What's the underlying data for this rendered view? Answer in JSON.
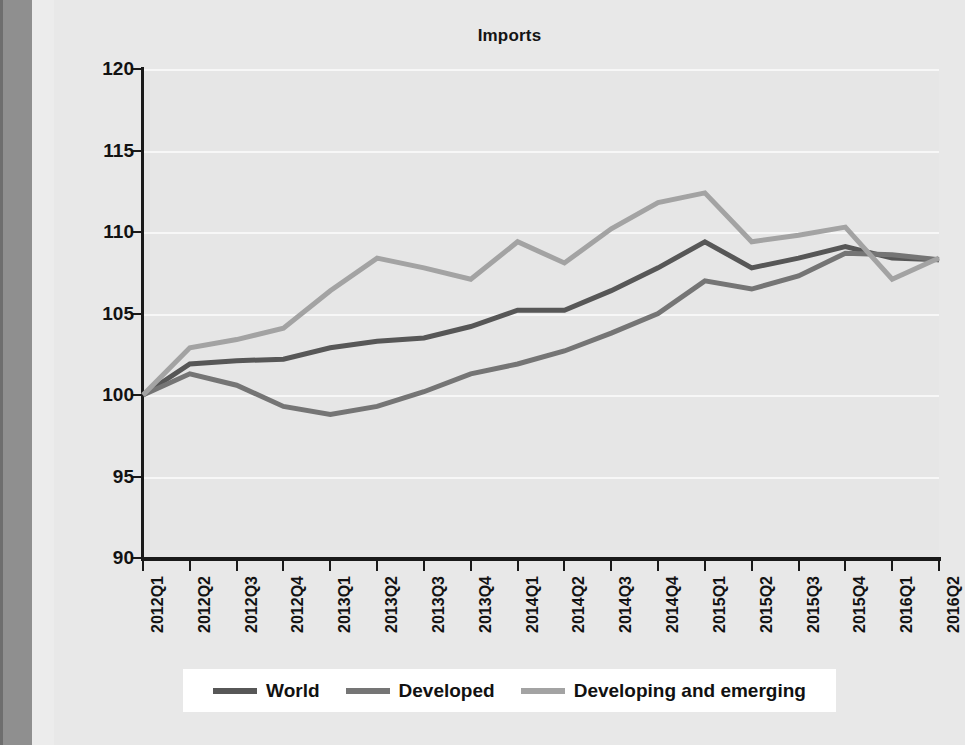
{
  "figure": {
    "title": "Imports",
    "background_color": "#e8e8e8",
    "plot_background_color": "#e6e6e6",
    "gridline_color": "#f7f7f7",
    "axis_color": "#1a1a1a"
  },
  "legend": {
    "position": "bottom",
    "items": [
      {
        "label": "World",
        "color": "#575757"
      },
      {
        "label": "Developed",
        "color": "#757575"
      },
      {
        "label": "Developing and emerging",
        "color": "#a3a3a3"
      }
    ]
  },
  "axes": {
    "y_ticks": [
      "120",
      "115",
      "110",
      "105",
      "100",
      "95",
      "90"
    ],
    "x_ticks": [
      "2012Q1",
      "2012Q2",
      "2012Q3",
      "2012Q4",
      "2013Q1",
      "2013Q2",
      "2013Q3",
      "2013Q4",
      "2014Q1",
      "2014Q2",
      "2014Q3",
      "2014Q4",
      "2015Q1",
      "2015Q2",
      "2015Q3",
      "2015Q4",
      "2016Q1",
      "2016Q2"
    ]
  },
  "chart_data": {
    "type": "line",
    "title": "Imports",
    "xlabel": "",
    "ylabel": "",
    "ylim": [
      90,
      120
    ],
    "ytick_step": 5,
    "grid": true,
    "legend_position": "bottom",
    "x": [
      "2012Q1",
      "2012Q2",
      "2012Q3",
      "2012Q4",
      "2013Q1",
      "2013Q2",
      "2013Q3",
      "2013Q4",
      "2014Q1",
      "2014Q2",
      "2014Q3",
      "2014Q4",
      "2015Q1",
      "2015Q2",
      "2015Q3",
      "2015Q4",
      "2016Q1",
      "2016Q2"
    ],
    "series": [
      {
        "name": "World",
        "color": "#575757",
        "values": [
          100.0,
          101.9,
          102.1,
          102.2,
          102.9,
          103.3,
          103.5,
          104.2,
          105.2,
          105.2,
          106.4,
          107.8,
          109.4,
          107.8,
          108.4,
          109.1,
          108.4,
          108.3
        ]
      },
      {
        "name": "Developed",
        "color": "#757575",
        "values": [
          100.0,
          101.3,
          100.6,
          99.3,
          98.8,
          99.3,
          100.2,
          101.3,
          101.9,
          102.7,
          103.8,
          105.0,
          107.0,
          106.5,
          107.3,
          108.7,
          108.6,
          108.3
        ]
      },
      {
        "name": "Developing and emerging",
        "color": "#a3a3a3",
        "values": [
          100.0,
          102.9,
          103.4,
          104.1,
          106.4,
          108.4,
          107.8,
          107.1,
          109.4,
          108.1,
          110.2,
          111.8,
          112.4,
          109.4,
          109.8,
          110.3,
          107.1,
          108.4
        ]
      }
    ]
  }
}
